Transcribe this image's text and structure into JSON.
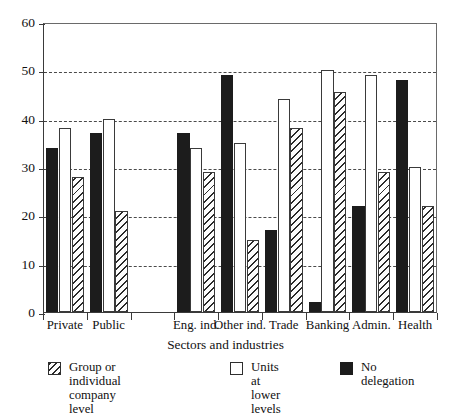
{
  "chart_data": {
    "type": "bar",
    "title": "",
    "xlabel": "Sectors and industries",
    "ylabel": "",
    "ylim": [
      0,
      60
    ],
    "yticks": [
      0,
      10,
      20,
      30,
      40,
      50,
      60
    ],
    "grid": "horizontal-dashed",
    "legend_position": "bottom",
    "categories": [
      "Private",
      "Public",
      "",
      "Eng. ind.",
      "Other ind.",
      "Trade",
      "Banking",
      "Admin.",
      "Health"
    ],
    "series": [
      {
        "name": "No delegation",
        "style": "black",
        "values": [
          34,
          37,
          null,
          37,
          49,
          17,
          2,
          22,
          48
        ]
      },
      {
        "name": "Units at lower  levels",
        "style": "white",
        "values": [
          38,
          40,
          null,
          34,
          35,
          44,
          50,
          49,
          30
        ]
      },
      {
        "name": "Group or individual\ncompany level",
        "style": "hatched",
        "values": [
          28,
          21,
          null,
          29,
          15,
          38,
          45.5,
          29,
          22
        ]
      }
    ]
  },
  "axis": {
    "y_tick_labels": [
      "60",
      "50",
      "40",
      "30",
      "20",
      "10",
      "0"
    ],
    "x_tick_labels": [
      "Private",
      "Public",
      "Eng. ind.",
      "Other ind.",
      "Trade",
      "Banking",
      "Admin.",
      "Health"
    ],
    "x_title": "Sectors and industries"
  },
  "legend": {
    "items": [
      {
        "label": "Group or individual\ncompany level",
        "style": "hatched"
      },
      {
        "label": "Units at lower  levels",
        "style": "white"
      },
      {
        "label": "No delegation",
        "style": "black"
      }
    ]
  },
  "colors": {
    "black_series": "#1c1c1c",
    "white_series": "#ffffff",
    "hatch_stroke": "#2b2b2b",
    "axis": "#3a3a3a",
    "grid": "#4a4a4a",
    "background": "#ffffff"
  }
}
